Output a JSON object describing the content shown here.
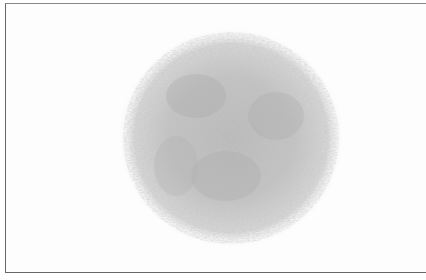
{
  "image": {
    "subject": "fuzzy spherical hair-like texture",
    "alt": "Grayscale fuzzy ball texture on white background within a thin bordered frame",
    "colors": {
      "background": "#ffffff",
      "border": "#666666",
      "fur_dark": "#9a9a9a",
      "fur_light": "#d8d8d8"
    }
  }
}
